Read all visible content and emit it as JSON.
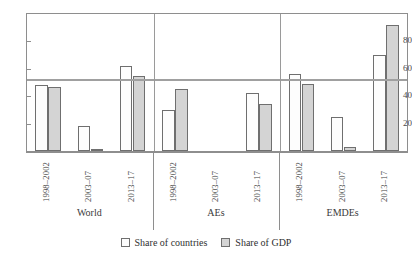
{
  "top_caption_fragment": "",
  "legend": {
    "position": "bottom-center",
    "items": [
      {
        "key": "countries",
        "label": "Share of countries",
        "color": "#fdfdfd"
      },
      {
        "key": "gdp",
        "label": "Share of GDP",
        "color": "#d4d4d4"
      }
    ]
  },
  "axis": {
    "y_ticks": [
      "20",
      "40",
      "60",
      "80"
    ],
    "y_tick_values": [
      20,
      40,
      60,
      80
    ],
    "y_min": 0,
    "y_max": 100
  },
  "groups": [
    {
      "name": "World",
      "periods": [
        "1998–2002",
        "2003–07",
        "2013–17"
      ]
    },
    {
      "name": "AEs",
      "periods": [
        "1998–2002",
        "2003–07",
        "2013–17"
      ]
    },
    {
      "name": "EMDEs",
      "periods": [
        "1998–2002",
        "2003–07",
        "2013–17"
      ]
    }
  ],
  "chart_data": {
    "type": "bar",
    "title": "",
    "subtitle": "",
    "xlabel": "",
    "ylabel": "",
    "ylim": [
      0,
      100
    ],
    "yticks": [
      20,
      40,
      60,
      80
    ],
    "grid": false,
    "legend_position": "bottom-center",
    "categories": [
      "World 1998–2002",
      "World 2003–07",
      "World 2013–17",
      "AEs 1998–2002",
      "AEs 2003–07",
      "AEs 2013–17",
      "EMDEs 1998–2002",
      "EMDEs 2003–07",
      "EMDEs 2013–17"
    ],
    "group_labels": [
      "World",
      "AEs",
      "EMDEs"
    ],
    "period_labels": [
      "1998–2002",
      "2003–07",
      "2013–17"
    ],
    "series": [
      {
        "name": "Share of countries",
        "color": "#fdfdfd",
        "values": [
          48,
          18,
          62,
          30,
          0,
          42,
          56,
          25,
          70
        ]
      },
      {
        "name": "Share of GDP",
        "color": "#d4d4d4",
        "values": [
          46.5,
          1.5,
          55,
          45,
          0,
          34,
          49,
          3,
          92
        ]
      }
    ],
    "annotations": [
      {
        "type": "hline",
        "value": 52,
        "color": "#a0a0a0",
        "label": ""
      }
    ]
  }
}
